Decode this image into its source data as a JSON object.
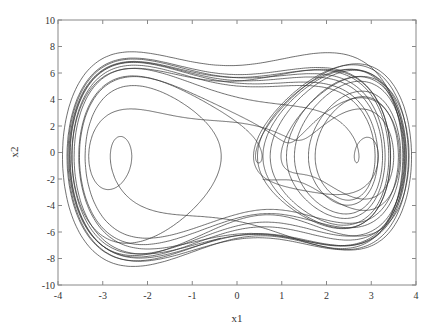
{
  "chart_data": {
    "type": "line",
    "title": "",
    "xlabel": "x1",
    "ylabel": "x2",
    "xlim": [
      -4,
      4
    ],
    "ylim": [
      -10,
      10
    ],
    "xticks": [
      -4,
      -3,
      -2,
      -1,
      0,
      1,
      2,
      3,
      4
    ],
    "yticks": [
      -10,
      -8,
      -6,
      -4,
      -2,
      0,
      2,
      4,
      6,
      8,
      10
    ],
    "grid": false,
    "legend": null,
    "series": [
      {
        "name": "trajectory",
        "description": "Chaotic phase-plane trajectory (x2 vs x1) of a forced double-well oscillator; two-lobe butterfly shape spanning x1 from about -3.9 to 3.9 and x2 from about -8.6 to 7.6",
        "color": "#333333",
        "envelope": {
          "x1_min": -3.9,
          "x1_max": 3.9,
          "x2_min": -8.6,
          "x2_max": 7.6
        },
        "approx_points": [
          [
            -3.85,
            0.0
          ],
          [
            -3.5,
            4.5
          ],
          [
            -2.3,
            7.0
          ],
          [
            -1.0,
            5.5
          ],
          [
            0.2,
            1.5
          ],
          [
            0.5,
            0.0
          ],
          [
            0.1,
            -1.0
          ],
          [
            -0.2,
            0.5
          ],
          [
            0.9,
            3.0
          ],
          [
            2.3,
            6.3
          ],
          [
            3.3,
            3.5
          ],
          [
            3.75,
            0.0
          ],
          [
            3.3,
            -5.0
          ],
          [
            2.2,
            -8.5
          ],
          [
            0.5,
            -6.0
          ],
          [
            -1.5,
            -3.5
          ],
          [
            -2.3,
            -7.2
          ],
          [
            -3.5,
            -4.0
          ],
          [
            -3.85,
            0.0
          ]
        ]
      }
    ]
  },
  "axes": {
    "x_label": "x1",
    "y_label": "x2",
    "x_tick_labels": [
      "-4",
      "-3",
      "-2",
      "-1",
      "0",
      "1",
      "2",
      "3",
      "4"
    ],
    "y_tick_labels": [
      "-10",
      "-8",
      "-6",
      "-4",
      "-2",
      "0",
      "2",
      "4",
      "6",
      "8",
      "10"
    ]
  },
  "style": {
    "line_color": "#333333",
    "axis_color": "#888888",
    "background": "#ffffff"
  }
}
